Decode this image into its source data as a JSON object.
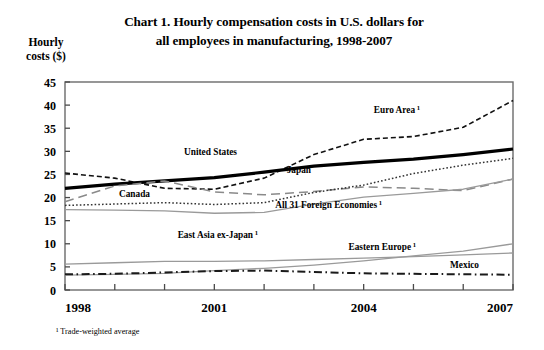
{
  "title": "Chart 1. Hourly compensation costs in U.S. dollars for all employees in manufacturing, 1998-2007",
  "title_line1": "Chart 1. Hourly compensation costs in U.S. dollars for",
  "title_line2": "all employees in manufacturing, 1998-2007",
  "ylabel_line1": "Hourly",
  "ylabel_line2": "costs ($)",
  "footnote": "¹ Trade-weighted average",
  "chart_data": {
    "type": "line",
    "title": "Chart 1. Hourly compensation costs in U.S. dollars for all employees in manufacturing, 1998-2007",
    "xlabel": "",
    "ylabel": "Hourly costs ($)",
    "x": [
      1998,
      1999,
      2000,
      2001,
      2002,
      2003,
      2004,
      2005,
      2006,
      2007
    ],
    "xlim": [
      1998,
      2007
    ],
    "ylim": [
      0,
      45
    ],
    "xticks": [
      1998,
      1999,
      2000,
      2001,
      2002,
      2003,
      2004,
      2005,
      2006,
      2007
    ],
    "xtick_labels_shown": [
      "1998",
      "2001",
      "2004",
      "2007"
    ],
    "yticks": [
      0,
      5,
      10,
      15,
      20,
      25,
      30,
      35,
      40,
      45
    ],
    "grid": false,
    "legend": "inline-labels",
    "series": [
      {
        "name": "Euro Area ¹",
        "label": "Euro Area",
        "label_sup": "1",
        "style": "short-dash",
        "color": "#111111",
        "width": 1.6,
        "values": [
          25.3,
          24.2,
          22.0,
          21.8,
          24.2,
          29.3,
          32.6,
          33.2,
          35.2,
          41.0
        ]
      },
      {
        "name": "United States",
        "label": "United States",
        "label_sup": "",
        "style": "solid-thick",
        "color": "#000000",
        "width": 3.2,
        "values": [
          22.0,
          22.9,
          23.6,
          24.3,
          25.5,
          26.8,
          27.6,
          28.3,
          29.3,
          30.5
        ]
      },
      {
        "name": "Japan",
        "label": "Japan",
        "label_sup": "",
        "style": "long-dash",
        "color": "#8a8a8a",
        "width": 1.5,
        "values": [
          19.1,
          22.5,
          23.6,
          21.2,
          20.6,
          21.3,
          22.3,
          22.0,
          21.5,
          24.0
        ]
      },
      {
        "name": "Canada",
        "label": "Canada",
        "label_sup": "",
        "style": "dotted",
        "color": "#333333",
        "width": 1.5,
        "values": [
          18.3,
          18.6,
          18.9,
          18.5,
          18.9,
          21.1,
          22.7,
          25.2,
          27.0,
          28.5
        ]
      },
      {
        "name": "All 31 Foreign Economies ¹",
        "label": "All 31 Foreign Economies",
        "label_sup": "1",
        "style": "solid-thin",
        "color": "#9a9a9a",
        "width": 1.3,
        "values": [
          17.4,
          17.3,
          17.1,
          16.6,
          16.8,
          18.6,
          20.1,
          20.9,
          21.8,
          24.0
        ]
      },
      {
        "name": "East Asia ex-Japan¹",
        "label": "East Asia ex-Japan",
        "label_sup": "1",
        "style": "solid-thin",
        "color": "#9a9a9a",
        "width": 1.3,
        "values": [
          5.6,
          5.9,
          6.2,
          6.2,
          6.3,
          6.6,
          6.9,
          7.2,
          7.6,
          8.0
        ]
      },
      {
        "name": "Eastern Europe ¹",
        "label": "Eastern Europe",
        "label_sup": "1",
        "style": "solid-thin",
        "color": "#9a9a9a",
        "width": 1.3,
        "values": [
          3.2,
          3.4,
          3.6,
          4.2,
          4.7,
          5.4,
          6.3,
          7.4,
          8.4,
          10.0
        ]
      },
      {
        "name": "Mexico",
        "label": "Mexico",
        "label_sup": "",
        "style": "dash-dot",
        "color": "#1a1a1a",
        "width": 2.0,
        "values": [
          3.4,
          3.5,
          3.8,
          4.1,
          4.2,
          3.9,
          3.6,
          3.5,
          3.4,
          3.3
        ]
      }
    ],
    "annotations": [
      {
        "text": "Euro Area",
        "sup": "1",
        "x": 420,
        "y": 113
      },
      {
        "text": "United States",
        "sup": "",
        "x": 237,
        "y": 155
      },
      {
        "text": "Japan",
        "sup": "",
        "x": 311,
        "y": 173
      },
      {
        "text": "Canada",
        "sup": "",
        "x": 150,
        "y": 197
      },
      {
        "text": "All 31 Foreign Economies",
        "sup": "1",
        "x": 382,
        "y": 208
      },
      {
        "text": "East Asia ex-Japan",
        "sup": "1",
        "x": 258,
        "y": 238
      },
      {
        "text": "Eastern Europe",
        "sup": "1",
        "x": 416,
        "y": 250
      },
      {
        "text": "Mexico",
        "sup": "",
        "x": 479,
        "y": 268
      }
    ]
  }
}
